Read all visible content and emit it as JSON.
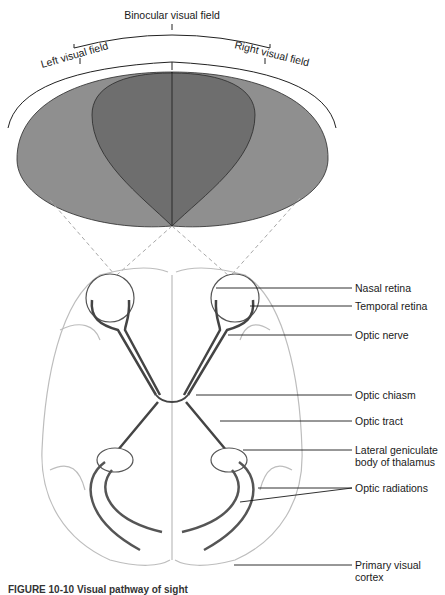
{
  "fields": {
    "binocular": "Binocular visual field",
    "left": "Left visual field",
    "right": "Right visual field",
    "colors": {
      "outer": "#8f8f8f",
      "inner": "#6e6e6e",
      "stroke": "#2a2a2a"
    }
  },
  "labels": [
    {
      "id": "nasal-retina",
      "text": "Nasal retina"
    },
    {
      "id": "temporal-retina",
      "text": "Temporal retina"
    },
    {
      "id": "optic-nerve",
      "text": "Optic nerve"
    },
    {
      "id": "optic-chiasm",
      "text": "Optic chiasm"
    },
    {
      "id": "optic-tract",
      "text": "Optic tract"
    },
    {
      "id": "lateral-geniculate",
      "text": "Lateral geniculate body of thalamus"
    },
    {
      "id": "optic-radiations",
      "text": "Optic radiations"
    },
    {
      "id": "primary-visual-cortex",
      "text": "Primary visual cortex"
    }
  ],
  "caption": "FIGURE 10-10 Visual pathway of sight"
}
